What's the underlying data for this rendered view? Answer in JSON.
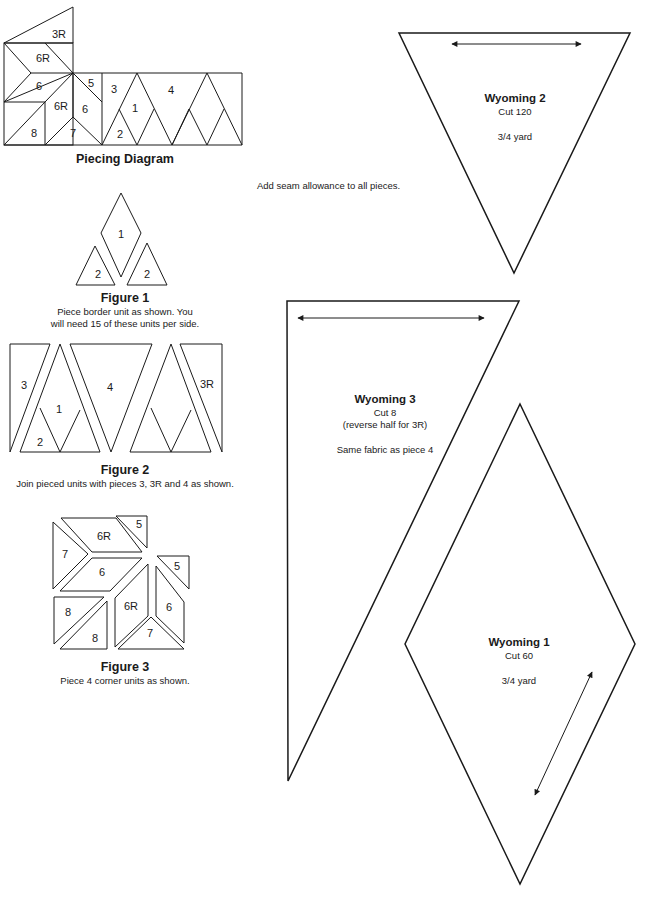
{
  "piecing_diagram": {
    "caption": "Piecing Diagram",
    "labels": [
      "3R",
      "6R",
      "6",
      "6R",
      "5",
      "6",
      "8",
      "7",
      "3",
      "1",
      "4",
      "2"
    ]
  },
  "figure1": {
    "title": "Figure 1",
    "text_line1": "Piece border unit as shown. You",
    "text_line2": "will need 15 of these units per side.",
    "labels": [
      "1",
      "2",
      "2"
    ]
  },
  "figure2": {
    "title": "Figure 2",
    "text": "Join pieced units with pieces 3, 3R and 4 as shown.",
    "labels": [
      "3",
      "1",
      "2",
      "4",
      "3R"
    ]
  },
  "figure3": {
    "title": "Figure 3",
    "text": "Piece 4 corner units as shown.",
    "labels": [
      "5",
      "6R",
      "7",
      "6",
      "5",
      "8",
      "6R",
      "6",
      "8",
      "7"
    ]
  },
  "note": "Add seam allowance to all pieces.",
  "templates": [
    {
      "name": "Wyoming 2",
      "cut": "Cut 120",
      "extra1": "",
      "extra2": "3/4 yard"
    },
    {
      "name": "Wyoming 3",
      "cut": "Cut 8",
      "extra1": "(reverse half for 3R)",
      "extra2": "Same fabric as piece 4"
    },
    {
      "name": "Wyoming 1",
      "cut": "Cut 60",
      "extra1": "",
      "extra2": "3/4 yard"
    }
  ]
}
